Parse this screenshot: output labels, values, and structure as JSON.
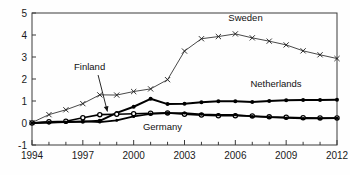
{
  "chart_data": {
    "type": "line",
    "title": "",
    "subtitle": "",
    "xlabel": "",
    "ylabel": "",
    "xlim": [
      1994,
      2012
    ],
    "ylim": [
      -1,
      5
    ],
    "x_ticks_major": [
      1994,
      1997,
      2000,
      2003,
      2006,
      2009,
      2012
    ],
    "x_tick_labels": [
      "1994",
      "1997",
      "2000",
      "2003",
      "2006",
      "2009",
      "2012"
    ],
    "x_ticks_minor": [
      1995,
      1996,
      1998,
      1999,
      2001,
      2002,
      2004,
      2005,
      2007,
      2008,
      2010,
      2011
    ],
    "y_ticks": [
      -1,
      0,
      1,
      2,
      3,
      4,
      5
    ],
    "y_tick_labels": [
      "-1",
      "0",
      "1",
      "2",
      "3",
      "4",
      "5"
    ],
    "grid": false,
    "legend_position": "inline-annotations",
    "x": [
      1994,
      1995,
      1996,
      1997,
      1998,
      1999,
      2000,
      2001,
      2002,
      2003,
      2004,
      2005,
      2006,
      2007,
      2008,
      2009,
      2010,
      2011,
      2012
    ],
    "series": [
      {
        "name": "Sweden",
        "marker": "x",
        "color": "#1a1a1a",
        "line_width": 0.8,
        "label_x": 2006.6,
        "label_y": 4.62,
        "values": [
          0.02,
          0.38,
          0.6,
          0.88,
          1.28,
          1.27,
          1.43,
          1.55,
          1.97,
          3.27,
          3.83,
          3.93,
          4.05,
          3.87,
          3.72,
          3.55,
          3.28,
          3.1,
          2.93
        ]
      },
      {
        "name": "Netherlands",
        "marker": "filled-circle",
        "color": "#000000",
        "line_width": 2.0,
        "label_x": 2008.4,
        "label_y": 1.62,
        "values": [
          0.0,
          0.02,
          0.04,
          0.06,
          0.1,
          0.46,
          0.74,
          1.1,
          0.86,
          0.88,
          0.94,
          0.99,
          0.99,
          0.96,
          1.0,
          1.03,
          1.05,
          1.05,
          1.06
        ]
      },
      {
        "name": "Finland",
        "marker": "open-circle",
        "color": "#000000",
        "line_width": 1.6,
        "label_x": 1997.4,
        "label_y": 2.4,
        "arrow_from_x": 1997.9,
        "arrow_from_y": 2.18,
        "arrow_to_x": 1998.45,
        "arrow_to_y": 0.52,
        "values": [
          0.0,
          0.06,
          0.08,
          0.24,
          0.38,
          0.4,
          0.42,
          0.44,
          0.46,
          0.4,
          0.36,
          0.33,
          0.33,
          0.32,
          0.28,
          0.26,
          0.24,
          0.23,
          0.23
        ]
      },
      {
        "name": "Germany",
        "marker": "filled-circle-small",
        "color": "#000000",
        "line_width": 1.6,
        "label_x": 2001.7,
        "label_y": -0.3,
        "values": [
          0.0,
          0.03,
          0.05,
          0.08,
          0.04,
          0.12,
          0.3,
          0.41,
          0.45,
          0.45,
          0.4,
          0.37,
          0.37,
          0.3,
          0.26,
          0.23,
          0.21,
          0.21,
          0.22
        ]
      }
    ]
  }
}
